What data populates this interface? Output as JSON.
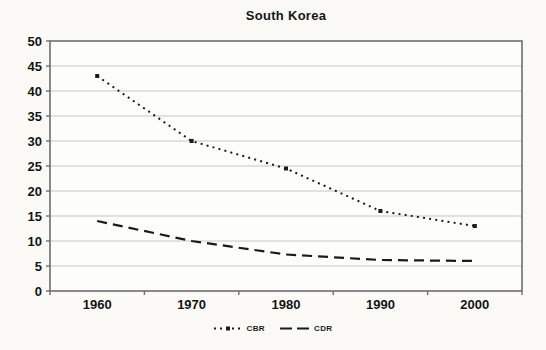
{
  "title": "South Korea",
  "chart_data": {
    "type": "line",
    "title": "South Korea",
    "categories": [
      "1960",
      "1970",
      "1980",
      "1990",
      "2000"
    ],
    "series": [
      {
        "name": "CBR",
        "values": [
          43,
          30,
          24.5,
          16,
          13
        ],
        "line_style": "dotted",
        "marker": "square"
      },
      {
        "name": "CDR",
        "values": [
          14,
          10,
          7.3,
          6.2,
          6
        ],
        "line_style": "dashed",
        "marker": "none"
      }
    ],
    "xlabel": "",
    "ylabel": "",
    "ylim": [
      0,
      50
    ],
    "ytick_step": 5,
    "yticks": [
      0,
      5,
      10,
      15,
      20,
      25,
      30,
      35,
      40,
      45,
      50
    ],
    "grid": "horizontal",
    "legend_position": "bottom-center"
  },
  "colors": {
    "line": "#1b1b1b",
    "grid": "#c6c6c6",
    "border": "#6e6e6e",
    "plot_background": "#fdfdfb",
    "page_background": "#fbfaf7",
    "label_text": "#141414"
  }
}
